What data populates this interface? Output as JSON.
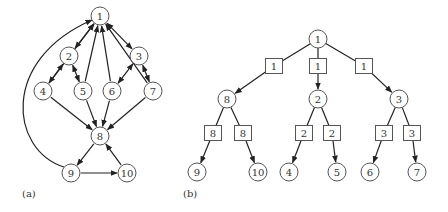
{
  "colors": {
    "stroke": "#222222",
    "node_border": "#555555",
    "text": "#333333",
    "background": "#ffffff"
  },
  "panel_a": {
    "label": "(a)",
    "nodes": [
      {
        "id": "1",
        "x": 100,
        "y": 16
      },
      {
        "id": "2",
        "x": 69,
        "y": 56
      },
      {
        "id": "3",
        "x": 139,
        "y": 56
      },
      {
        "id": "4",
        "x": 43,
        "y": 91
      },
      {
        "id": "5",
        "x": 83,
        "y": 91
      },
      {
        "id": "6",
        "x": 112,
        "y": 91
      },
      {
        "id": "7",
        "x": 153,
        "y": 91
      },
      {
        "id": "8",
        "x": 100,
        "y": 136
      },
      {
        "id": "9",
        "x": 71,
        "y": 173
      },
      {
        "id": "10",
        "x": 127,
        "y": 173
      }
    ],
    "edges": [
      {
        "from": "1",
        "to": "2",
        "bidirectional": true
      },
      {
        "from": "1",
        "to": "3",
        "bidirectional": true
      },
      {
        "from": "2",
        "to": "4",
        "bidirectional": true
      },
      {
        "from": "2",
        "to": "5",
        "bidirectional": true
      },
      {
        "from": "3",
        "to": "6",
        "bidirectional": true
      },
      {
        "from": "3",
        "to": "7",
        "bidirectional": true
      },
      {
        "from": "4",
        "to": "1"
      },
      {
        "from": "5",
        "to": "1"
      },
      {
        "from": "6",
        "to": "1"
      },
      {
        "from": "7",
        "to": "1"
      },
      {
        "from": "4",
        "to": "8"
      },
      {
        "from": "5",
        "to": "8"
      },
      {
        "from": "6",
        "to": "8"
      },
      {
        "from": "7",
        "to": "8"
      },
      {
        "from": "8",
        "to": "9"
      },
      {
        "from": "9",
        "to": "10"
      },
      {
        "from": "10",
        "to": "8"
      },
      {
        "from": "9",
        "to": "1",
        "curved": true
      }
    ]
  },
  "panel_b": {
    "label": "(b)",
    "nodes": [
      {
        "id": "1",
        "x": 318,
        "y": 39
      },
      {
        "id": "8",
        "x": 227,
        "y": 99
      },
      {
        "id": "2",
        "x": 318,
        "y": 99
      },
      {
        "id": "3",
        "x": 399,
        "y": 99
      },
      {
        "id": "9",
        "x": 197,
        "y": 172
      },
      {
        "id": "10",
        "x": 258,
        "y": 172
      },
      {
        "id": "4",
        "x": 289,
        "y": 172
      },
      {
        "id": "5",
        "x": 337,
        "y": 172
      },
      {
        "id": "6",
        "x": 370,
        "y": 172
      },
      {
        "id": "7",
        "x": 417,
        "y": 172
      }
    ],
    "boxes": [
      {
        "label": "1",
        "x": 274,
        "y": 66,
        "parent": "1",
        "child": "8"
      },
      {
        "label": "1",
        "x": 318,
        "y": 66,
        "parent": "1",
        "child": "2"
      },
      {
        "label": "1",
        "x": 364,
        "y": 66,
        "parent": "1",
        "child": "3"
      },
      {
        "label": "8",
        "x": 213,
        "y": 133,
        "parent": "8",
        "child": "9"
      },
      {
        "label": "8",
        "x": 243,
        "y": 133,
        "parent": "8",
        "child": "10"
      },
      {
        "label": "2",
        "x": 304,
        "y": 133,
        "parent": "2",
        "child": "4"
      },
      {
        "label": "2",
        "x": 332,
        "y": 133,
        "parent": "2",
        "child": "5"
      },
      {
        "label": "3",
        "x": 384,
        "y": 133,
        "parent": "3",
        "child": "6"
      },
      {
        "label": "3",
        "x": 412,
        "y": 133,
        "parent": "3",
        "child": "7"
      }
    ]
  }
}
